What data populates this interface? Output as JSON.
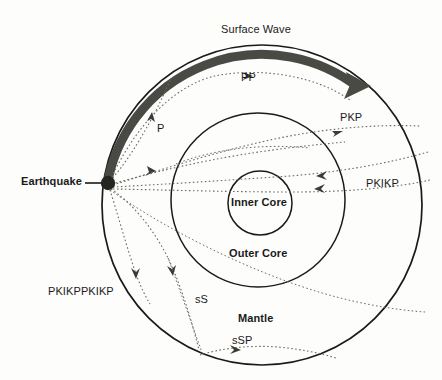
{
  "diagram": {
    "colors": {
      "outline": "#1a1a1a",
      "surface_wave": "#4a4a45",
      "ray_path": "#6b6b66",
      "text": "#1a1a1a",
      "background": "#fdfdfc",
      "earthquake_dot": "#262621"
    },
    "labels": {
      "earthquake": "Earthquake",
      "surface_wave": "Surface Wave",
      "pp": "PP",
      "p": "P",
      "pkp": "PKP",
      "pkikp": "PKIKP",
      "pkikppkikp": "PKIKPPKIKP",
      "ss": "sS",
      "ssp": "sSP",
      "inner_core": "Inner Core",
      "outer_core": "Outer Core",
      "mantle": "Mantle"
    },
    "geometry": {
      "earth_center_x": 262,
      "earth_center_y": 205,
      "earth_radius": 160,
      "outer_core_center_x": 258,
      "outer_core_center_y": 200,
      "outer_core_radius": 87,
      "inner_core_center_x": 260,
      "inner_core_center_y": 203,
      "inner_core_radius": 32,
      "earthquake_x": 108,
      "earthquake_y": 183,
      "earthquake_dot_radius": 7
    }
  }
}
